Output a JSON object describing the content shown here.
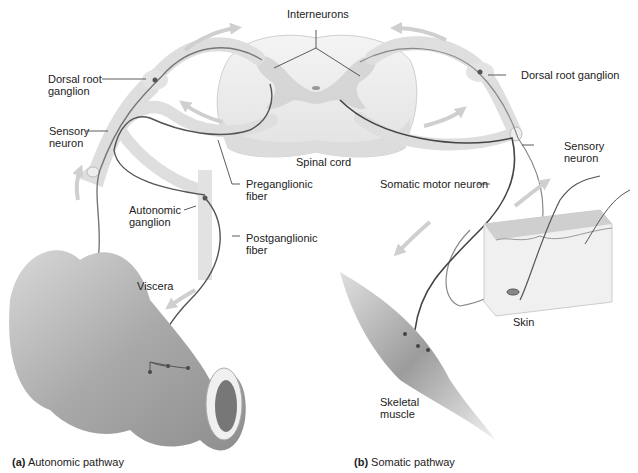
{
  "labels": {
    "interneurons": "Interneurons",
    "dorsal_root_ganglion_left_1": "Dorsal root",
    "dorsal_root_ganglion_left_2": "ganglion",
    "dorsal_root_ganglion_right": "Dorsal root ganglion",
    "sensory_neuron_left_1": "Sensory",
    "sensory_neuron_left_2": "neuron",
    "sensory_neuron_right_1": "Sensory",
    "sensory_neuron_right_2": "neuron",
    "spinal_cord": "Spinal cord",
    "preganglionic_1": "Preganglionic",
    "preganglionic_2": "fiber",
    "postganglionic_1": "Postganglionic",
    "postganglionic_2": "fiber",
    "autonomic_ganglion_1": "Autonomic",
    "autonomic_ganglion_2": "ganglion",
    "somatic_motor_neuron": "Somatic motor neuron",
    "viscera": "Viscera",
    "skin": "Skin",
    "skeletal_muscle_1": "Skeletal",
    "skeletal_muscle_2": "muscle"
  },
  "captions": {
    "a_letter": "(a)",
    "a_text": "Autonomic pathway",
    "b_letter": "(b)",
    "b_text": "Somatic pathway"
  },
  "colors": {
    "nerve_fill": "#e6e6e6",
    "nerve_line": "#555555",
    "arrow": "#cfcfcf",
    "tissue": "#bdbdbd"
  }
}
